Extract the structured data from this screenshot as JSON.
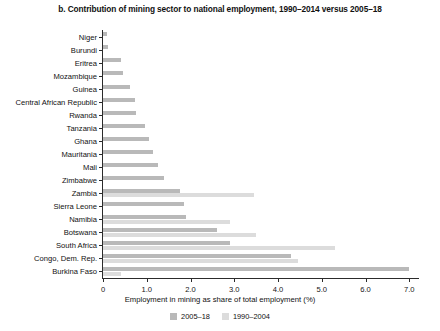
{
  "chart_data": {
    "type": "bar",
    "orientation": "horizontal",
    "title": "b. Contribution of mining sector to national employment, 1990–2014 versus 2005–18",
    "xlabel": "Employment in mining as share of total employment (%)",
    "ylabel": "",
    "xlim": [
      0,
      7.2
    ],
    "xticks": [
      0,
      1.0,
      2.0,
      3.0,
      4.0,
      5.0,
      6.0,
      7.0
    ],
    "xtick_labels": [
      "0",
      "1.0",
      "2.0",
      "3.0",
      "4.0",
      "5.0",
      "6.0",
      "7.0"
    ],
    "grid": false,
    "legend_position": "bottom",
    "categories": [
      "Niger",
      "Burundi",
      "Eritrea",
      "Mozambique",
      "Guinea",
      "Central African Republic",
      "Rwanda",
      "Tanzania",
      "Ghana",
      "Mauritania",
      "Mali",
      "Zimbabwe",
      "Zambia",
      "Sierra Leone",
      "Namibia",
      "Botswana",
      "South Africa",
      "Congo, Dem. Rep.",
      "Burkina Faso"
    ],
    "series": [
      {
        "name": "2005–18",
        "color": "#b9b9b9",
        "values": [
          0.08,
          0.12,
          0.42,
          0.45,
          0.62,
          0.72,
          0.75,
          0.95,
          1.05,
          1.15,
          1.25,
          1.4,
          1.75,
          1.85,
          1.9,
          2.6,
          2.9,
          4.3,
          7.0
        ]
      },
      {
        "name": "1990–2004",
        "color": "#dcdcdc",
        "values": [
          0.0,
          0.0,
          0.0,
          0.0,
          0.0,
          0.0,
          0.0,
          0.0,
          0.0,
          0.0,
          0.0,
          0.0,
          3.45,
          0.0,
          2.9,
          3.5,
          5.3,
          4.45,
          0.4
        ]
      }
    ],
    "legend": [
      {
        "label": "2005–18",
        "color": "#b9b9b9"
      },
      {
        "label": "1990–2004",
        "color": "#dcdcdc"
      }
    ]
  }
}
